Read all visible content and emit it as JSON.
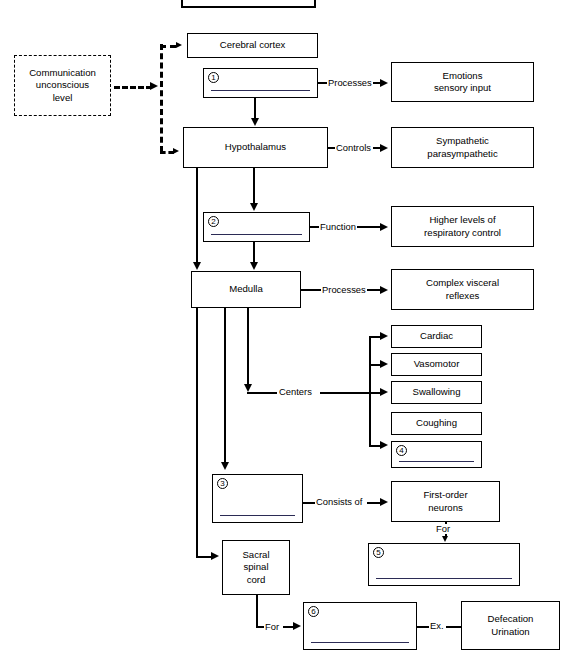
{
  "diagram": {
    "top_partial_box": {
      "label": "",
      "note": "cut off at top edge of screenshot"
    },
    "nodes": {
      "communication": "Communication\nunconscious\nlevel",
      "communication_lines": [
        "Communication",
        "unconscious",
        "level"
      ],
      "cerebral_cortex": "Cerebral cortex",
      "hypothalamus": "Hypothalamus",
      "medulla": "Medulla",
      "emotions": "Emotions\nsensory input",
      "emotions_lines": [
        "Emotions",
        "sensory input"
      ],
      "sympathetic": "Sympathetic\nparasympathetic",
      "sympathetic_lines": [
        "Sympathetic",
        "parasympathetic"
      ],
      "higher_levels": "Higher levels of\nrespiratory control",
      "higher_levels_lines": [
        "Higher levels of",
        "respiratory control"
      ],
      "complex_visceral": "Complex visceral\nreflexes",
      "complex_visceral_lines": [
        "Complex visceral",
        "reflexes"
      ],
      "cardiac": "Cardiac",
      "vasomotor": "Vasomotor",
      "swallowing": "Swallowing",
      "coughing": "Coughing",
      "first_order": "First-order\nneurons",
      "first_order_lines": [
        "First-order",
        "neurons"
      ],
      "sacral": "Sacral\nspinal\ncord",
      "sacral_lines": [
        "Sacral",
        "spinal",
        "cord"
      ],
      "defecation": "Defecation\nUrination",
      "defecation_lines": [
        "Defecation",
        "Urination"
      ]
    },
    "blanks": [
      {
        "number": "1",
        "value": ""
      },
      {
        "number": "2",
        "value": ""
      },
      {
        "number": "3",
        "value": ""
      },
      {
        "number": "4",
        "value": ""
      },
      {
        "number": "5",
        "value": ""
      },
      {
        "number": "6",
        "value": ""
      }
    ],
    "edge_labels": {
      "processes_1": "Processes",
      "controls": "Controls",
      "function": "Function",
      "processes_2": "Processes",
      "centers": "Centers",
      "consists_of": "Consists of",
      "for_1": "For",
      "for_2": "For",
      "ex": "Ex."
    },
    "colors": {
      "stroke": "#000000",
      "background": "#ffffff",
      "answer_line": "#2b2b55"
    }
  }
}
